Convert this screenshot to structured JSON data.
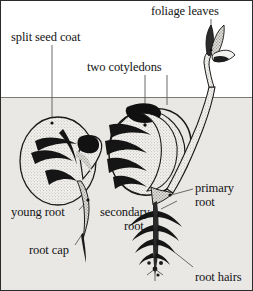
{
  "figure": {
    "width": 253,
    "height": 291,
    "soil_line_y": 96,
    "colors": {
      "above_soil": "#ffffff",
      "below_soil": "#e8e7e4",
      "ink": "#141414",
      "seed_fill": "#f2f1ee",
      "stipple": "#8d8b86",
      "leader": "#5a5a5a",
      "border": "#2b2b2b"
    }
  },
  "labels": [
    {
      "id": "foliage-leaves",
      "text": "foliage leaves",
      "x": 150,
      "y": 4,
      "align": "left"
    },
    {
      "id": "split-seed-coat",
      "text": "split seed coat",
      "x": 10,
      "y": 30,
      "align": "left"
    },
    {
      "id": "two-cotyledons",
      "text": "two cotyledons",
      "x": 86,
      "y": 60,
      "align": "left"
    },
    {
      "id": "primary-root",
      "text": "primary",
      "x": 194,
      "y": 181,
      "align": "left"
    },
    {
      "id": "primary-root-2",
      "text": "root",
      "x": 194,
      "y": 195,
      "align": "left"
    },
    {
      "id": "young-root",
      "text": "young root",
      "x": 10,
      "y": 205,
      "align": "left"
    },
    {
      "id": "secondary-root",
      "text": "secondary",
      "x": 99,
      "y": 205,
      "align": "left"
    },
    {
      "id": "secondary-root-2",
      "text": "root",
      "x": 123,
      "y": 219,
      "align": "left"
    },
    {
      "id": "root-cap",
      "text": "root cap",
      "x": 28,
      "y": 243,
      "align": "left"
    },
    {
      "id": "root-hairs",
      "text": "root hairs",
      "x": 194,
      "y": 270,
      "align": "left"
    }
  ],
  "parts": [
    {
      "id": "seed-left",
      "name": "germinating seed with young root"
    },
    {
      "id": "seed-right",
      "name": "seedling with shoot and branched root"
    },
    {
      "id": "foliage-cluster",
      "name": "emerging foliage leaves above soil"
    },
    {
      "id": "soil-surface",
      "name": "soil surface line"
    }
  ]
}
